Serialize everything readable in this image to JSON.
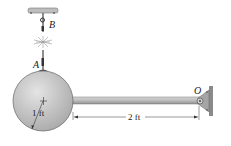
{
  "diagram": {
    "type": "mechanics-figure",
    "labels": {
      "point_a": "A",
      "point_b": "B",
      "point_o": "O",
      "radius": "1 ft",
      "rod_length": "2 ft"
    },
    "colors": {
      "sphere": "#c8c8c8",
      "rod": "#b8b8b8",
      "support": "#9a9a9a",
      "ink": "#222222"
    }
  }
}
